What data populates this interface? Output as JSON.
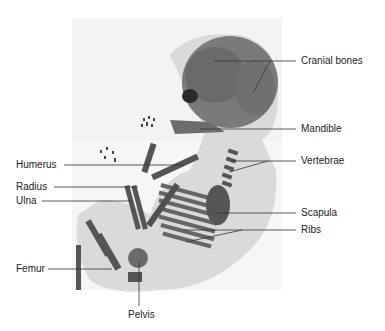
{
  "figure": {
    "colors": {
      "background": "#ffffff",
      "specimen_bg": "#efefef",
      "bone": "#5a5a5a",
      "soft_tissue": "#9a9a9a",
      "leader_line": "#333333",
      "label_text": "#222222"
    }
  },
  "labels": [
    {
      "id": "cranial-bones",
      "text": "Cranial bones"
    },
    {
      "id": "mandible",
      "text": "Mandible"
    },
    {
      "id": "vertebrae",
      "text": "Vertebrae"
    },
    {
      "id": "humerus",
      "text": "Humerus"
    },
    {
      "id": "radius",
      "text": "Radius"
    },
    {
      "id": "ulna",
      "text": "Ulna"
    },
    {
      "id": "scapula",
      "text": "Scapula"
    },
    {
      "id": "ribs",
      "text": "Ribs"
    },
    {
      "id": "femur",
      "text": "Femur"
    },
    {
      "id": "pelvis",
      "text": "Pelvis"
    }
  ]
}
